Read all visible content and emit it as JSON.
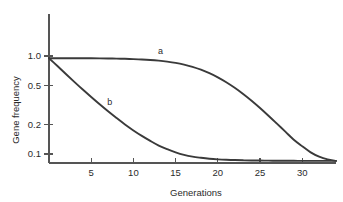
{
  "chart_data": {
    "type": "line",
    "title": "",
    "xlabel": "Generations",
    "ylabel": "Gene frequency",
    "xlim": [
      0,
      34
    ],
    "ylim": [
      0.075,
      1.15
    ],
    "yscale": "log",
    "xscale": "linear",
    "grid": false,
    "legend_position": "inline-annotation",
    "xticks": [
      5,
      10,
      15,
      20,
      25,
      30
    ],
    "xtick_labels": [
      "5",
      "10",
      "15",
      "20",
      "25",
      "30"
    ],
    "yticks": [
      1.0,
      0.5,
      0.2,
      0.1
    ],
    "ytick_labels": [
      "1.0",
      "0.5",
      "0.2",
      "0.1"
    ],
    "series": [
      {
        "name": "a",
        "label": "a",
        "label_x": 13.2,
        "label_y": 1.04,
        "x": [
          0,
          1,
          2,
          3,
          4,
          5,
          6,
          7,
          8,
          9,
          10,
          11,
          12,
          13,
          14,
          15,
          16,
          17,
          18,
          19,
          20,
          21,
          22,
          23,
          24,
          25,
          26,
          27,
          28,
          29,
          30,
          31,
          32,
          33,
          34
        ],
        "y": [
          0.95,
          0.95,
          0.95,
          0.949,
          0.948,
          0.947,
          0.945,
          0.943,
          0.94,
          0.936,
          0.93,
          0.922,
          0.911,
          0.896,
          0.876,
          0.85,
          0.816,
          0.775,
          0.725,
          0.668,
          0.606,
          0.54,
          0.474,
          0.41,
          0.35,
          0.295,
          0.246,
          0.204,
          0.169,
          0.14,
          0.12,
          0.104,
          0.094,
          0.088,
          0.085
        ]
      },
      {
        "name": "b",
        "label": "b",
        "label_x": 7.2,
        "label_y": 0.315,
        "x": [
          0,
          1,
          2,
          3,
          4,
          5,
          6,
          7,
          8,
          9,
          10,
          11,
          12,
          13,
          14,
          15,
          16,
          17,
          18,
          19,
          20,
          21,
          22,
          23,
          24,
          25,
          26,
          27,
          28,
          29,
          30,
          31,
          32,
          33,
          34
        ],
        "y": [
          0.95,
          0.79,
          0.655,
          0.545,
          0.455,
          0.382,
          0.322,
          0.273,
          0.233,
          0.2,
          0.174,
          0.153,
          0.136,
          0.122,
          0.112,
          0.104,
          0.098,
          0.094,
          0.0915,
          0.0895,
          0.0882,
          0.0873,
          0.0867,
          0.0862,
          0.0859,
          0.0857,
          0.0855,
          0.0854,
          0.0853,
          0.0852,
          0.0851,
          0.085,
          0.085,
          0.085,
          0.085
        ]
      }
    ],
    "colors": {
      "curve": "#3a3a3a",
      "axis": "#555555",
      "text": "#2b2b2b",
      "background": "#ffffff"
    }
  }
}
